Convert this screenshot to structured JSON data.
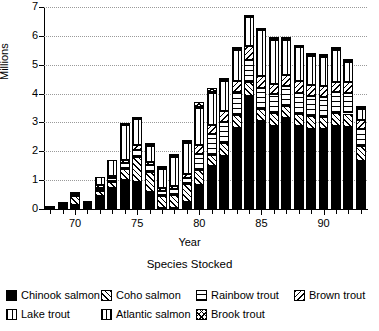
{
  "chart_data": {
    "type": "bar",
    "stacked": true,
    "title": "",
    "xlabel": "Year",
    "ylabel": "Millions",
    "ylim": [
      0,
      7
    ],
    "yticks": [
      0,
      1,
      2,
      3,
      4,
      5,
      6,
      7
    ],
    "ytick_labels": [
      "0",
      "1",
      "2",
      "3",
      "4",
      "5",
      "6",
      "7"
    ],
    "xtick_values": [
      70,
      75,
      80,
      85,
      90
    ],
    "xtick_labels": [
      "70",
      "75",
      "80",
      "85",
      "90"
    ],
    "grid": "horizontal-dotted",
    "legend_title": "Species Stocked",
    "legend_position": "below",
    "categories": [
      68,
      69,
      70,
      71,
      72,
      73,
      74,
      75,
      76,
      77,
      78,
      79,
      80,
      81,
      82,
      83,
      84,
      85,
      86,
      87,
      88,
      89,
      90,
      91,
      92,
      93
    ],
    "series": [
      {
        "name": "Chinook salmon",
        "pattern": "solid-black",
        "values": [
          0.0,
          0.08,
          0.15,
          0.13,
          0.44,
          0.73,
          1.0,
          0.95,
          0.6,
          0.02,
          0.03,
          0.24,
          0.82,
          1.48,
          1.83,
          2.8,
          3.92,
          3.06,
          2.88,
          3.14,
          2.88,
          2.79,
          2.76,
          2.88,
          2.85,
          1.66
        ]
      },
      {
        "name": "Coho salmon",
        "pattern": "diagonal-forward",
        "values": [
          0.02,
          0.05,
          0.3,
          0.05,
          0.2,
          0.22,
          0.38,
          0.85,
          0.7,
          0.42,
          0.45,
          0.62,
          0.52,
          0.4,
          0.46,
          0.46,
          0.48,
          0.42,
          0.44,
          0.43,
          0.42,
          0.44,
          0.42,
          0.44,
          0.46,
          0.52
        ]
      },
      {
        "name": "Rainbow trout",
        "pattern": "horizontal",
        "values": [
          0.0,
          0.02,
          0.05,
          0.02,
          0.1,
          0.14,
          0.22,
          0.25,
          0.22,
          0.18,
          0.2,
          0.22,
          0.58,
          0.72,
          0.72,
          0.8,
          0.75,
          0.72,
          0.66,
          0.7,
          0.72,
          0.68,
          0.7,
          0.72,
          0.7,
          0.6
        ]
      },
      {
        "name": "Brown trout",
        "pattern": "diagonal-backward",
        "values": [
          0.0,
          0.02,
          0.03,
          0.02,
          0.08,
          0.04,
          0.1,
          0.18,
          0.12,
          0.1,
          0.12,
          0.14,
          0.3,
          0.32,
          0.38,
          0.38,
          0.5,
          0.42,
          0.36,
          0.38,
          0.4,
          0.38,
          0.4,
          0.36,
          0.4,
          0.3
        ]
      },
      {
        "name": "Lake trout",
        "pattern": "vertical-wide",
        "values": [
          0.02,
          0.04,
          0.02,
          0.02,
          0.28,
          0.56,
          1.2,
          0.88,
          0.55,
          0.68,
          1.0,
          1.08,
          1.28,
          1.1,
          1.06,
          1.08,
          1.0,
          1.58,
          1.52,
          1.22,
          1.18,
          1.02,
          1.0,
          1.12,
          0.7,
          0.4
        ]
      },
      {
        "name": "Atlantic salmon",
        "pattern": "vertical-narrow",
        "values": [
          0.0,
          0.0,
          0.0,
          0.0,
          0.0,
          0.0,
          0.02,
          0.02,
          0.02,
          0.02,
          0.02,
          0.02,
          0.02,
          0.02,
          0.02,
          0.02,
          0.02,
          0.02,
          0.02,
          0.02,
          0.02,
          0.02,
          0.02,
          0.02,
          0.02,
          0.02
        ]
      },
      {
        "name": "Brook trout",
        "pattern": "crosshatch",
        "values": [
          0.0,
          0.0,
          0.0,
          0.0,
          0.0,
          0.0,
          0.02,
          0.04,
          0.02,
          0.02,
          0.02,
          0.08,
          0.18,
          0.16,
          0.02,
          0.02,
          0.02,
          0.02,
          0.02,
          0.02,
          0.02,
          0.02,
          0.02,
          0.02,
          0.02,
          0.02
        ]
      }
    ]
  },
  "legend": {
    "title": "Species Stocked",
    "rows": [
      [
        {
          "label": "Chinook salmon",
          "pattern": "p-chinook",
          "left": 0
        },
        {
          "label": "Coho salmon",
          "pattern": "p-coho",
          "left": 95
        },
        {
          "label": "Rainbow trout",
          "pattern": "p-rainbow",
          "left": 190
        },
        {
          "label": "Brown trout",
          "pattern": "p-brown",
          "left": 288
        }
      ],
      [
        {
          "label": "Lake trout",
          "pattern": "p-lake",
          "left": 0
        },
        {
          "label": "Atlantic salmon",
          "pattern": "p-atlantic",
          "left": 95
        },
        {
          "label": "Brook trout",
          "pattern": "p-brook",
          "left": 190
        }
      ]
    ]
  }
}
